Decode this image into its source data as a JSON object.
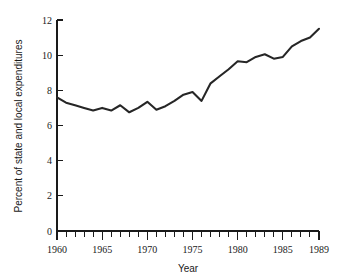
{
  "chart_data": {
    "type": "line",
    "title": "",
    "xlabel": "Year",
    "ylabel": "Percent of state and local expenditures",
    "xlim": [
      1960,
      1989
    ],
    "ylim": [
      0,
      12
    ],
    "grid": false,
    "legend": null,
    "line_color": "#262626",
    "x": [
      1960,
      1961,
      1962,
      1963,
      1964,
      1965,
      1966,
      1967,
      1968,
      1969,
      1970,
      1971,
      1972,
      1973,
      1974,
      1975,
      1976,
      1977,
      1978,
      1979,
      1980,
      1981,
      1982,
      1983,
      1984,
      1985,
      1986,
      1987,
      1988,
      1989
    ],
    "values": [
      7.6,
      7.3,
      7.15,
      7.0,
      6.85,
      7.0,
      6.85,
      7.15,
      6.75,
      7.0,
      7.35,
      6.9,
      7.1,
      7.4,
      7.75,
      7.9,
      7.4,
      8.4,
      8.8,
      9.2,
      9.65,
      9.6,
      9.9,
      10.05,
      9.8,
      9.9,
      10.5,
      10.8,
      11.0,
      11.5
    ],
    "y_ticks": [
      0,
      2,
      4,
      6,
      8,
      10,
      12
    ],
    "y_tick_labels": [
      "0",
      "2",
      "4",
      "6",
      "8",
      "10",
      "12"
    ],
    "x_ticks_major": [
      1960,
      1965,
      1970,
      1975,
      1980,
      1985,
      1989
    ],
    "x_tick_labels": [
      "1960",
      "1965",
      "1970",
      "1975",
      "1980",
      "1985",
      "1989"
    ],
    "x_ticks_minor": [
      1961,
      1962,
      1963,
      1964,
      1966,
      1967,
      1968,
      1969,
      1971,
      1972,
      1973,
      1974,
      1976,
      1977,
      1978,
      1979,
      1981,
      1982,
      1983,
      1984,
      1986,
      1987,
      1988
    ]
  }
}
